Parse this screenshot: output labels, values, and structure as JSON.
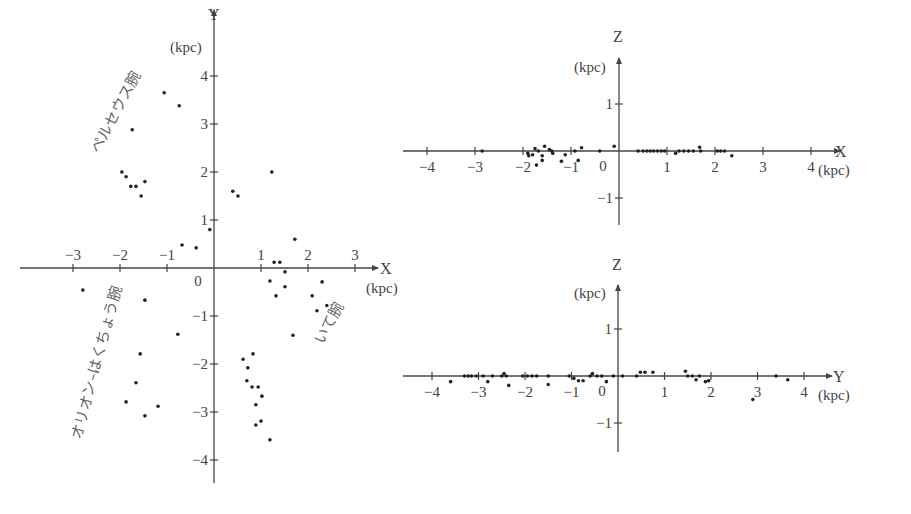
{
  "chart_data": [
    {
      "type": "scatter",
      "title": "",
      "xlabel": "X",
      "ylabel": "Y",
      "unit": "(kpc)",
      "xlim": [
        -3.2,
        3.5
      ],
      "ylim": [
        -4.5,
        4.4
      ],
      "xticks": [
        "-3",
        "-2",
        "-1",
        "1",
        "2",
        "3"
      ],
      "yticks": [
        "4",
        "3",
        "2",
        "1",
        "-1",
        "-2",
        "-3",
        "-4"
      ],
      "origin_label": "0",
      "grid": false,
      "annotations": [
        {
          "text": "ペルセウス腕",
          "x": -2.0,
          "y": 3.2,
          "rotate": -62
        },
        {
          "text": "オリオン–はくちょう腕",
          "x": -2.4,
          "y": -2.0,
          "rotate": -75
        },
        {
          "text": "いて腕",
          "x": 2.55,
          "y": -1.2,
          "rotate": -62
        }
      ],
      "points": [
        [
          -1.06,
          3.65
        ],
        [
          -0.74,
          3.38
        ],
        [
          -1.74,
          2.88
        ],
        [
          -1.96,
          2.0
        ],
        [
          -1.87,
          1.9
        ],
        [
          -1.77,
          1.7
        ],
        [
          -1.66,
          1.7
        ],
        [
          -1.47,
          1.8
        ],
        [
          -1.55,
          1.5
        ],
        [
          0.4,
          1.6
        ],
        [
          0.51,
          1.5
        ],
        [
          1.23,
          2.0
        ],
        [
          -0.09,
          0.8
        ],
        [
          1.72,
          0.6
        ],
        [
          -0.68,
          0.48
        ],
        [
          -0.38,
          0.42
        ],
        [
          1.28,
          0.12
        ],
        [
          1.4,
          0.12
        ],
        [
          1.51,
          -0.08
        ],
        [
          1.19,
          -0.27
        ],
        [
          1.51,
          -0.39
        ],
        [
          1.32,
          -0.58
        ],
        [
          2.3,
          -0.29
        ],
        [
          2.09,
          -0.58
        ],
        [
          2.19,
          -0.89
        ],
        [
          2.4,
          -0.78
        ],
        [
          1.68,
          -1.4
        ],
        [
          -2.79,
          -0.46
        ],
        [
          -1.47,
          -0.67
        ],
        [
          -0.77,
          -1.38
        ],
        [
          -1.57,
          -1.79
        ],
        [
          -1.66,
          -2.39
        ],
        [
          -1.87,
          -2.79
        ],
        [
          -1.47,
          -3.08
        ],
        [
          -1.19,
          -2.88
        ],
        [
          0.62,
          -1.9
        ],
        [
          0.83,
          -1.79
        ],
        [
          0.72,
          -2.08
        ],
        [
          0.7,
          -2.35
        ],
        [
          0.81,
          -2.48
        ],
        [
          0.94,
          -2.48
        ],
        [
          1.02,
          -2.67
        ],
        [
          0.89,
          -2.85
        ],
        [
          1.0,
          -3.19
        ],
        [
          0.89,
          -3.27
        ],
        [
          1.19,
          -3.58
        ]
      ]
    },
    {
      "type": "scatter",
      "title": "",
      "xlabel": "X",
      "ylabel": "Z",
      "unit": "(kpc)",
      "xlim": [
        -4.4,
        4.5
      ],
      "ylim": [
        -1.6,
        1.5
      ],
      "xticks": [
        "-4",
        "-3",
        "-2",
        "-1",
        "1",
        "2",
        "3",
        "4"
      ],
      "yticks": [
        "1",
        "-1"
      ],
      "origin_label": "0",
      "grid": false,
      "points": [
        [
          -2.85,
          0.0
        ],
        [
          -1.9,
          -0.05
        ],
        [
          -1.88,
          -0.1
        ],
        [
          -1.8,
          -0.08
        ],
        [
          -1.75,
          0.05
        ],
        [
          -1.68,
          0.0
        ],
        [
          -1.6,
          -0.1
        ],
        [
          -1.55,
          0.1
        ],
        [
          -1.45,
          0.03
        ],
        [
          -1.4,
          0.0
        ],
        [
          -1.38,
          -0.05
        ],
        [
          -1.72,
          -0.3
        ],
        [
          -1.6,
          -0.2
        ],
        [
          -1.12,
          -0.08
        ],
        [
          -1.2,
          -0.22
        ],
        [
          -0.92,
          0.0
        ],
        [
          -0.78,
          0.07
        ],
        [
          -0.85,
          -0.2
        ],
        [
          -0.4,
          0.0
        ],
        [
          -0.1,
          0.1
        ],
        [
          0.4,
          0.0
        ],
        [
          0.5,
          0.0
        ],
        [
          0.58,
          0.0
        ],
        [
          0.65,
          0.0
        ],
        [
          0.72,
          0.0
        ],
        [
          0.8,
          0.0
        ],
        [
          0.88,
          0.0
        ],
        [
          0.95,
          0.0
        ],
        [
          1.18,
          -0.05
        ],
        [
          1.25,
          0.0
        ],
        [
          1.35,
          0.0
        ],
        [
          1.45,
          0.0
        ],
        [
          1.55,
          0.0
        ],
        [
          1.68,
          0.08
        ],
        [
          1.7,
          0.0
        ],
        [
          2.05,
          0.0
        ],
        [
          2.12,
          0.0
        ],
        [
          2.2,
          0.0
        ],
        [
          2.35,
          -0.1
        ]
      ]
    },
    {
      "type": "scatter",
      "title": "",
      "xlabel": "Y",
      "ylabel": "Z",
      "unit": "(kpc)",
      "xlim": [
        -4.4,
        4.7
      ],
      "ylim": [
        -1.6,
        1.6
      ],
      "xticks": [
        "-4",
        "-3",
        "-2",
        "-1",
        "1",
        "2",
        "3",
        "4"
      ],
      "yticks": [
        "1",
        "-1"
      ],
      "origin_label": "0",
      "grid": false,
      "points": [
        [
          -3.6,
          -0.12
        ],
        [
          -3.3,
          0.0
        ],
        [
          -3.22,
          0.0
        ],
        [
          -3.15,
          0.0
        ],
        [
          -3.05,
          0.0
        ],
        [
          -2.9,
          0.0
        ],
        [
          -2.8,
          -0.12
        ],
        [
          -2.7,
          0.0
        ],
        [
          -2.5,
          0.0
        ],
        [
          -2.45,
          0.05
        ],
        [
          -2.4,
          0.0
        ],
        [
          -2.35,
          -0.2
        ],
        [
          -2.05,
          0.0
        ],
        [
          -1.95,
          0.0
        ],
        [
          -1.85,
          0.0
        ],
        [
          -1.75,
          0.0
        ],
        [
          -1.5,
          0.0
        ],
        [
          -1.5,
          -0.18
        ],
        [
          -1.05,
          0.0
        ],
        [
          -0.95,
          -0.05
        ],
        [
          -0.85,
          -0.1
        ],
        [
          -0.75,
          -0.1
        ],
        [
          -0.6,
          0.0
        ],
        [
          -0.55,
          0.05
        ],
        [
          -0.45,
          0.0
        ],
        [
          -0.35,
          0.0
        ],
        [
          -0.25,
          -0.12
        ],
        [
          -0.1,
          0.0
        ],
        [
          0.1,
          0.0
        ],
        [
          0.4,
          0.0
        ],
        [
          0.48,
          0.08
        ],
        [
          0.58,
          0.08
        ],
        [
          0.75,
          0.08
        ],
        [
          1.45,
          0.1
        ],
        [
          1.5,
          0.0
        ],
        [
          1.6,
          0.0
        ],
        [
          1.68,
          -0.08
        ],
        [
          1.75,
          0.0
        ],
        [
          1.88,
          -0.12
        ],
        [
          1.95,
          -0.1
        ],
        [
          3.4,
          0.0
        ],
        [
          3.65,
          -0.08
        ],
        [
          2.9,
          -0.5
        ]
      ]
    }
  ]
}
